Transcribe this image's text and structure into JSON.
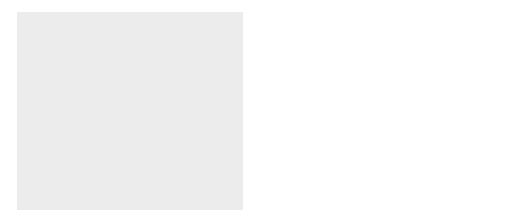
{
  "titles": {
    "liver": "Liver",
    "blood": "Blood",
    "muscle": "Muscle"
  },
  "liver": {
    "glucose": "Glucose",
    "gluconeogenesis": "gluconeogenesis",
    "pyruvate": "Pyruvate",
    "nh3_base": "NH",
    "nh3_sub": "3",
    "urea": "Urea",
    "alanine": "Alanine"
  },
  "muscle": {
    "glucose": "Glucose",
    "glycogen": "Glycogen",
    "pyruvate": "Pyruvate",
    "amino_acid": "α-Amino acid",
    "transamination": "transamination",
    "keto_acid": "α-Keto acid",
    "alanine": "Alanine"
  },
  "colors": {
    "background_panel": "#eeeeee",
    "organ_dark": "#6e6e6e",
    "organ_light": "#d8d8d8",
    "arrow_fill": "#ffffff",
    "arrow_stroke": "#333333",
    "metabolite_grey": "#8a8a8a"
  }
}
